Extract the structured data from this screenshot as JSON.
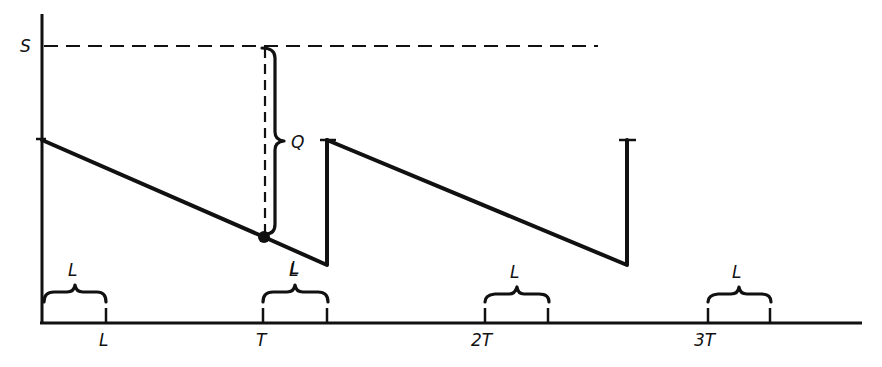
{
  "diagram": {
    "type": "inventory-sawtooth",
    "y_axis_labels": {
      "S": "S",
      "Q": "Q"
    },
    "x_axis_labels": [
      "L",
      "T",
      "2T",
      "3T"
    ],
    "lead_time_brace_labels": [
      "L",
      "L",
      "L",
      "L"
    ],
    "lead_time_label_on_curve": "L",
    "colors": {
      "ink": "#111111",
      "background": "#ffffff"
    }
  }
}
